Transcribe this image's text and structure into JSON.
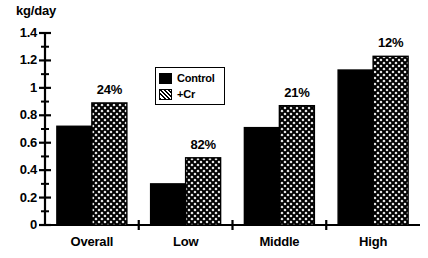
{
  "chart_data": {
    "type": "bar",
    "title": "",
    "subtitle": "",
    "xlabel": "",
    "ylabel": "kg/day",
    "ylim": [
      0,
      1.4
    ],
    "ytick_labels": [
      "0",
      "0.2",
      "0.4",
      "0.6",
      "0.8",
      "1",
      "1.2",
      "1.4"
    ],
    "ytick_values": [
      0,
      0.2,
      0.4,
      0.6,
      0.8,
      1.0,
      1.2,
      1.4
    ],
    "minor_tick_step": 0.1,
    "grid": false,
    "legend_position": "upper-center",
    "categories": [
      "Overall",
      "Low",
      "Middle",
      "High"
    ],
    "series": [
      {
        "name": "Control",
        "fill": "solid-black",
        "values": [
          0.72,
          0.3,
          0.71,
          1.13
        ]
      },
      {
        "name": "+Cr",
        "fill": "crosshatch",
        "values": [
          0.89,
          0.49,
          0.87,
          1.23
        ]
      }
    ],
    "annotations": [
      {
        "category": "Overall",
        "text": "24%"
      },
      {
        "category": "Low",
        "text": "82%"
      },
      {
        "category": "Middle",
        "text": "21%"
      },
      {
        "category": "High",
        "text": "12%"
      }
    ]
  },
  "axis": {
    "unit_label": "kg/day"
  },
  "legend": {
    "items": [
      {
        "label": "Control"
      },
      {
        "label": "+Cr"
      }
    ]
  },
  "colors": {
    "foreground": "#000000",
    "background": "#ffffff",
    "control_fill": "#000000",
    "cr_fill": "#ffffff"
  }
}
